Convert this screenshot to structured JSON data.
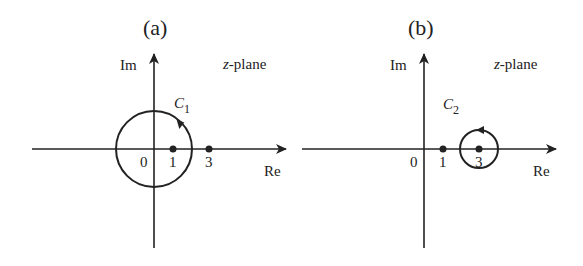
{
  "figure": {
    "panels": [
      {
        "id": "a",
        "title": "(a)",
        "plane_label_var": "z",
        "plane_label_rest": "-plane",
        "im_label": "Im",
        "re_label": "Re",
        "contour_name": "C",
        "contour_sub": "1",
        "ticks": [
          "0",
          "1",
          "3"
        ],
        "points": [
          1,
          3
        ],
        "contour": {
          "center": 0,
          "radius": 2,
          "direction": "counterclockwise",
          "encloses": [
            1
          ]
        }
      },
      {
        "id": "b",
        "title": "(b)",
        "plane_label_var": "z",
        "plane_label_rest": "-plane",
        "im_label": "Im",
        "re_label": "Re",
        "contour_name": "C",
        "contour_sub": "2",
        "ticks": [
          "0",
          "1",
          "3"
        ],
        "points": [
          1,
          3
        ],
        "contour": {
          "center": 3,
          "radius": 1,
          "direction": "counterclockwise",
          "encloses": [
            3
          ]
        }
      }
    ],
    "colors": {
      "stroke": "#222222",
      "background": "#ffffff"
    }
  }
}
